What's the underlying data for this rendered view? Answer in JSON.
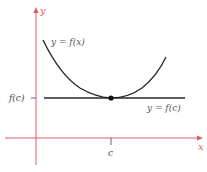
{
  "diagram": {
    "colors": {
      "axes": "#e05a66",
      "curve": "#2a2a2a",
      "tangent_line": "#2a2a2a",
      "point": "#111111",
      "text": "#444444"
    },
    "axes": {
      "x_label": "x",
      "y_label": "y"
    },
    "labels": {
      "curve": "y = f(x)",
      "tangent": "y = f(c)",
      "y_tick": "f(c)",
      "x_tick": "c"
    },
    "curve": {
      "shape": "convex parabola-like",
      "minimum_at": "c",
      "minimum_value": "f(c)"
    },
    "point": {
      "x": "c",
      "y": "f(c)"
    }
  }
}
